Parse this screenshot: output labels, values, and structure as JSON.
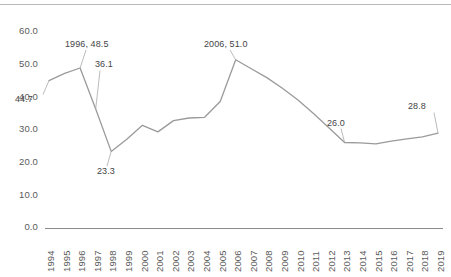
{
  "chart_data": {
    "type": "line",
    "title": "",
    "subtitle": "",
    "xlabel": "",
    "ylabel": "",
    "grid": false,
    "legend": "none",
    "xlim": [
      "1994",
      "2019"
    ],
    "ylim": [
      0.0,
      60.0
    ],
    "ytick_labels": [
      "60.0",
      "50.0",
      "40.0",
      "30.0",
      "20.0",
      "10.0",
      "0.0"
    ],
    "ytick_values": [
      60.0,
      50.0,
      40.0,
      30.0,
      20.0,
      10.0,
      0.0
    ],
    "categories": [
      "1994",
      "1995",
      "1996",
      "1997",
      "1998",
      "1999",
      "2000",
      "2001",
      "2002",
      "2003",
      "2004",
      "2005",
      "2006",
      "2007",
      "2008",
      "2009",
      "2010",
      "2011",
      "2012",
      "2013",
      "2014",
      "2015",
      "2016",
      "2017",
      "2018",
      "2019"
    ],
    "values": [
      44.7,
      46.9,
      48.5,
      36.1,
      23.3,
      27.0,
      31.2,
      29.2,
      32.6,
      33.4,
      33.6,
      38.4,
      51.0,
      48.3,
      45.6,
      42.4,
      38.8,
      34.8,
      30.4,
      26.0,
      25.9,
      25.6,
      26.4,
      27.1,
      27.7,
      28.8
    ],
    "series_color": "#9a9a9a",
    "data_labels": [
      {
        "key": "1994",
        "text": "44.7",
        "value": 44.7,
        "year": "1994"
      },
      {
        "key": "1996",
        "text": "1996, 48.5",
        "value": 48.5,
        "year": "1996"
      },
      {
        "key": "1997",
        "text": "36.1",
        "value": 36.1,
        "year": "1997"
      },
      {
        "key": "1998",
        "text": "23.3",
        "value": 23.3,
        "year": "1998"
      },
      {
        "key": "2006",
        "text": "2006, 51.0",
        "value": 51.0,
        "year": "2006"
      },
      {
        "key": "2013",
        "text": "26.0",
        "value": 26.0,
        "year": "2013"
      },
      {
        "key": "2019",
        "text": "28.8",
        "value": 28.8,
        "year": "2019"
      }
    ]
  },
  "labels": {
    "y0": "60.0",
    "y1": "50.0",
    "y2": "40.0",
    "y3": "30.0",
    "y4": "20.0",
    "y5": "10.0",
    "y6": "0.0",
    "x1994": "1994",
    "x1995": "1995",
    "x1996": "1996",
    "x1997": "1997",
    "x1998": "1998",
    "x1999": "1999",
    "x2000": "2000",
    "x2001": "2001",
    "x2002": "2002",
    "x2003": "2003",
    "x2004": "2004",
    "x2005": "2005",
    "x2006": "2006",
    "x2007": "2007",
    "x2008": "2008",
    "x2009": "2009",
    "x2010": "2010",
    "x2011": "2011",
    "x2012": "2012",
    "x2013": "2013",
    "x2014": "2014",
    "x2015": "2015",
    "x2016": "2016",
    "x2017": "2017",
    "x2018": "2018",
    "x2019": "2019",
    "d_44_7": "44.7",
    "d_1996": "1996, 48.5",
    "d_36_1": "36.1",
    "d_23_3": "23.3",
    "d_2006": "2006, 51.0",
    "d_26_0": "26.0",
    "d_28_8": "28.8"
  },
  "colors": {
    "series": "#9a9a9a",
    "axis": "#8a8a8a",
    "text": "#5a5a5a",
    "label_text": "#444444",
    "top_rule": "#b9b9b9",
    "background": "#ffffff"
  }
}
